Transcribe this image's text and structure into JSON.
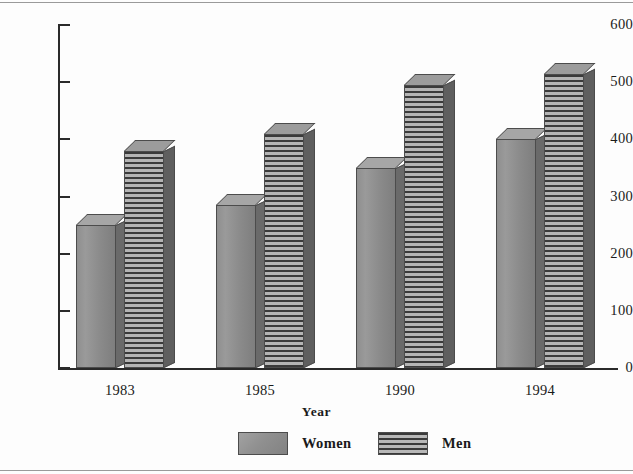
{
  "chart_data": {
    "type": "bar",
    "title": "",
    "xlabel": "Year",
    "ylabel": "",
    "categories": [
      "1983",
      "1985",
      "1990",
      "1994"
    ],
    "series": [
      {
        "name": "Women",
        "values": [
          250,
          285,
          350,
          400
        ],
        "style": "solid-gray"
      },
      {
        "name": "Men",
        "values": [
          380,
          410,
          495,
          515
        ],
        "style": "horizontal-stripes"
      }
    ],
    "ylim": [
      0,
      600
    ],
    "yticks": [
      0,
      100,
      200,
      300,
      400,
      500,
      600
    ],
    "ytick_labels": [
      "0",
      "100",
      "200",
      "300",
      "400",
      "500",
      "600"
    ],
    "grid": false,
    "legend_position": "bottom-center",
    "colors": {
      "women_fill": "#8f8f8f",
      "men_stripe_dark": "#3a3a3a",
      "men_stripe_light": "#b4b4b4",
      "axis": "#2a2a2a",
      "text": "#1a1a1a",
      "background": "#fdfdfd"
    }
  },
  "legend": {
    "items": [
      {
        "label": "Women",
        "swatch": "solid-gray-swatch"
      },
      {
        "label": "Men",
        "swatch": "striped-swatch"
      }
    ]
  }
}
